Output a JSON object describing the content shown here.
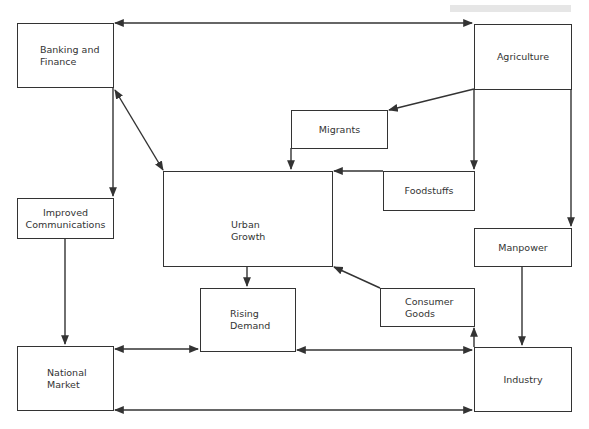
{
  "header": {
    "mark": "g"
  },
  "nodes": {
    "banking": {
      "label": "Banking and\nFinance"
    },
    "agriculture": {
      "label": "Agriculture"
    },
    "migrants": {
      "label": "Migrants"
    },
    "foodstuffs": {
      "label": "Foodstuffs"
    },
    "urban_growth": {
      "label": "Urban\nGrowth"
    },
    "improved_communications": {
      "label": "Improved\nCommunications"
    },
    "manpower": {
      "label": "Manpower"
    },
    "consumer_goods": {
      "label": "Consumer\nGoods"
    },
    "rising_demand": {
      "label": "Rising\nDemand"
    },
    "national_market": {
      "label": "National\nMarket"
    },
    "industry": {
      "label": "Industry"
    }
  },
  "edges": [
    {
      "from": "Banking and Finance",
      "to": "Agriculture",
      "direction": "both"
    },
    {
      "from": "Banking and Finance",
      "to": "Urban Growth",
      "direction": "both"
    },
    {
      "from": "Banking and Finance",
      "to": "Improved Communications",
      "direction": "forward"
    },
    {
      "from": "Agriculture",
      "to": "Migrants",
      "direction": "forward"
    },
    {
      "from": "Agriculture",
      "to": "Foodstuffs",
      "direction": "forward"
    },
    {
      "from": "Agriculture",
      "to": "Manpower",
      "direction": "forward"
    },
    {
      "from": "Migrants",
      "to": "Urban Growth",
      "direction": "forward"
    },
    {
      "from": "Foodstuffs",
      "to": "Urban Growth",
      "direction": "forward"
    },
    {
      "from": "Urban Growth",
      "to": "Rising Demand",
      "direction": "forward"
    },
    {
      "from": "Consumer Goods",
      "to": "Urban Growth",
      "direction": "forward"
    },
    {
      "from": "Improved Communications",
      "to": "National Market",
      "direction": "forward"
    },
    {
      "from": "Manpower",
      "to": "Industry",
      "direction": "forward"
    },
    {
      "from": "Industry",
      "to": "Consumer Goods",
      "direction": "forward"
    },
    {
      "from": "National Market",
      "to": "Rising Demand",
      "direction": "both"
    },
    {
      "from": "Rising Demand",
      "to": "Industry",
      "direction": "both"
    },
    {
      "from": "National Market",
      "to": "Industry",
      "direction": "both"
    }
  ],
  "colors": {
    "line": "#333333",
    "header_bar": "#e6e6e6"
  }
}
